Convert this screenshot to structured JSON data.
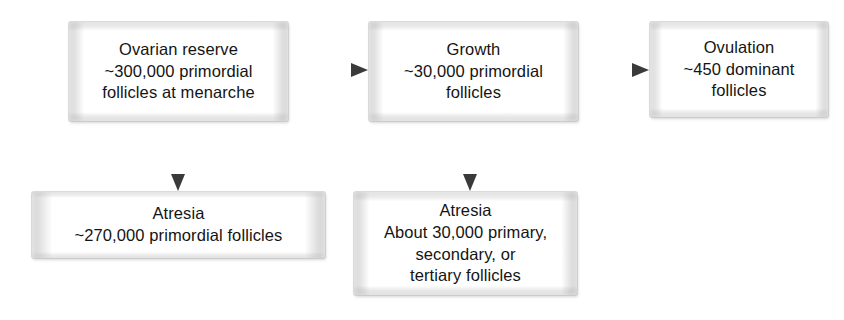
{
  "diagram": {
    "colors": {
      "box_fill": "#ffffff",
      "box_edge": "#c8c8c8",
      "text": "#141414",
      "arrow": "#4a4a4a",
      "background": "#ffffff"
    },
    "nodes": [
      {
        "id": "ovarian-reserve",
        "label": "Ovarian reserve\n~300,000 primordial\nfollicles at menarche",
        "x": 69,
        "y": 22,
        "w": 219,
        "h": 99
      },
      {
        "id": "growth",
        "label": "Growth\n~30,000 primordial\nfollicles",
        "x": 369,
        "y": 22,
        "w": 209,
        "h": 99
      },
      {
        "id": "ovulation",
        "label": "Ovulation\n~450 dominant\nfollicles",
        "x": 650,
        "y": 22,
        "w": 178,
        "h": 95
      },
      {
        "id": "atresia-primordial",
        "label": "Atresia\n~270,000 primordial follicles",
        "x": 32,
        "y": 192,
        "w": 293,
        "h": 66
      },
      {
        "id": "atresia-primary-secondary-tertiary",
        "label": "Atresia\nAbout 30,000 primary,\nsecondary, or\ntertiary follicles",
        "x": 354,
        "y": 192,
        "w": 223,
        "h": 103
      }
    ],
    "connectors": [
      {
        "id": "reserve-to-growth",
        "from": "ovarian-reserve",
        "to": "growth",
        "orientation": "horizontal",
        "x1": 289,
        "y1": 70,
        "x2": 368,
        "y2": 70
      },
      {
        "id": "growth-to-ovulation",
        "from": "growth",
        "to": "ovulation",
        "orientation": "horizontal",
        "x1": 579,
        "y1": 70,
        "x2": 649,
        "y2": 70
      },
      {
        "id": "reserve-to-atresia",
        "from": "ovarian-reserve",
        "to": "atresia-primordial",
        "orientation": "vertical",
        "x1": 178,
        "y1": 121,
        "x2": 178,
        "y2": 191
      },
      {
        "id": "growth-to-atresia",
        "from": "growth",
        "to": "atresia-primary-secondary-tertiary",
        "orientation": "vertical",
        "x1": 470,
        "y1": 121,
        "x2": 470,
        "y2": 191
      }
    ]
  }
}
